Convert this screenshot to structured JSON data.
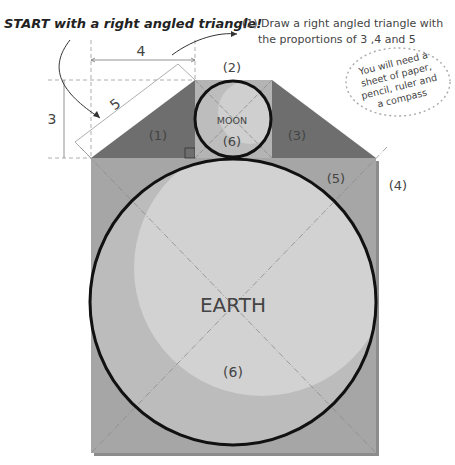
{
  "title": "START with a right angled triangle!",
  "instruction": {
    "line1": "(1) Draw a right angled triangle with",
    "line2": "the proportions of 3 ,4 and 5"
  },
  "note": {
    "line1": "You will need a",
    "line2": "sheet of paper,",
    "line3": "pencil, ruler and",
    "line4": "a compass"
  },
  "dimensions": {
    "side_a": "3",
    "side_b": "4",
    "hypotenuse": "5"
  },
  "labels": {
    "triangle_left": "(1)",
    "moon_square": "(2)",
    "triangle_right": "(3)",
    "outer_square": "(4)",
    "earth_corner": "(5)",
    "moon_center": "(6)",
    "earth_center": "(6)",
    "moon": "MOON",
    "earth": "EARTH"
  },
  "colors": {
    "background": "#ffffff",
    "outer_square": "#a6a6a6",
    "triangles": "#6e6e6e",
    "moon_square": "#b4b4b4",
    "earth_fill": "#c6c6c6",
    "earth_highlight": "#d4d4d4",
    "moon_fill": "#cdcdcd",
    "circle_stroke": "#111111",
    "guide_lines": "#8a8a8a"
  }
}
